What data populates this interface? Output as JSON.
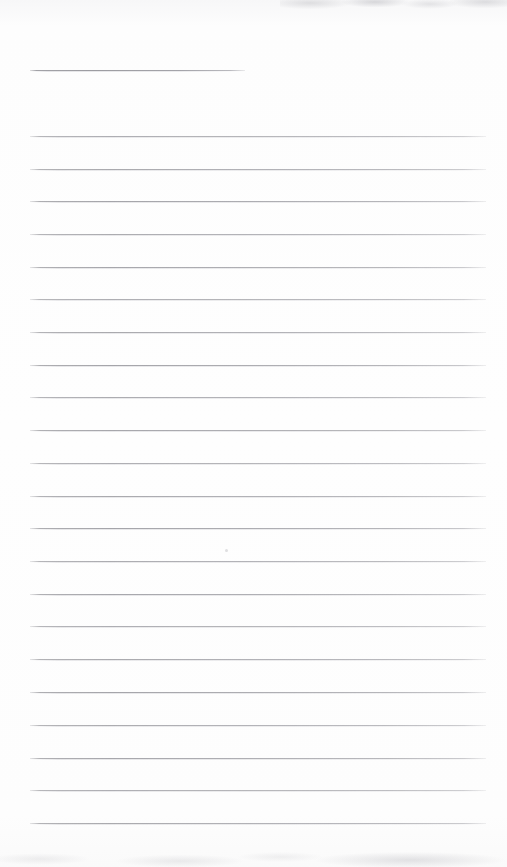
{
  "page": {
    "kind": "scanned-blank-ruled-page",
    "width": 867,
    "background_color": "#fdfdfd",
    "rule_color": "#a9a9ad",
    "text_content": ""
  },
  "header_rule": {
    "name": "title-underline",
    "y": 70,
    "x_start": 30,
    "x_end": 245,
    "color": "#9e9ea3"
  },
  "rules": {
    "count": 22,
    "x_start": 30,
    "x_end": 486,
    "spacing": 32.7,
    "color": "#a9a9ad",
    "y_positions": [
      136,
      169,
      201,
      234,
      267,
      299,
      332,
      365,
      397,
      430,
      463,
      496,
      528,
      561,
      594,
      626,
      659,
      692,
      725,
      758,
      790,
      823
    ]
  },
  "artifacts": {
    "top_smudge": {
      "label": "scanner-edge-shadow-top",
      "color": "#a0a0a6"
    },
    "bottom_smudge": {
      "label": "scanner-edge-shadow-bottom",
      "color": "#9e9ea6"
    },
    "speck": {
      "x": 225,
      "y": 549,
      "color": "#b4b4ba"
    }
  }
}
